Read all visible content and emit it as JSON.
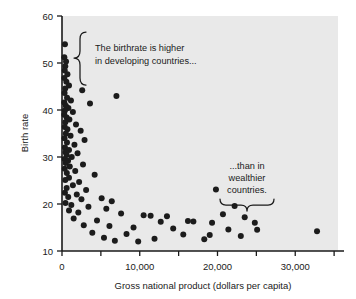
{
  "chart_data": {
    "type": "scatter",
    "title": "",
    "xlabel": "Gross national product (dollars per capita)",
    "ylabel": "Birth rate",
    "xlim": [
      0,
      35500
    ],
    "ylim": [
      10,
      60
    ],
    "xticks": [
      0,
      10000,
      20000,
      30000
    ],
    "xtick_labels": [
      "0",
      "10,000",
      "20,000",
      "30,000"
    ],
    "xminor_ticks": [
      5000,
      15000,
      25000,
      35000
    ],
    "yticks": [
      10,
      20,
      30,
      40,
      50,
      60
    ],
    "ytick_labels": [
      "10",
      "20",
      "30",
      "40",
      "50",
      "60"
    ],
    "grid": false,
    "legend": "none",
    "marker_color": "#1c1c1c",
    "plot_background": "#e9e9e9",
    "points": [
      [
        380,
        54.0
      ],
      [
        300,
        51.2
      ],
      [
        520,
        50.3
      ],
      [
        420,
        49.3
      ],
      [
        350,
        48.4
      ],
      [
        700,
        47.6
      ],
      [
        300,
        46.8
      ],
      [
        560,
        46.0
      ],
      [
        900,
        45.2
      ],
      [
        420,
        44.6
      ],
      [
        2600,
        44.2
      ],
      [
        330,
        43.6
      ],
      [
        7000,
        43.0
      ],
      [
        650,
        42.6
      ],
      [
        1150,
        42.0
      ],
      [
        300,
        41.6
      ],
      [
        3600,
        41.4
      ],
      [
        500,
        40.9
      ],
      [
        820,
        40.4
      ],
      [
        380,
        39.9
      ],
      [
        1400,
        39.6
      ],
      [
        300,
        39.0
      ],
      [
        600,
        38.4
      ],
      [
        950,
        38.0
      ],
      [
        430,
        37.4
      ],
      [
        1800,
        36.9
      ],
      [
        350,
        36.4
      ],
      [
        700,
        35.9
      ],
      [
        2400,
        35.6
      ],
      [
        500,
        35.0
      ],
      [
        1100,
        34.5
      ],
      [
        320,
        34.0
      ],
      [
        2900,
        33.6
      ],
      [
        640,
        33.1
      ],
      [
        1600,
        32.6
      ],
      [
        380,
        32.0
      ],
      [
        900,
        31.5
      ],
      [
        450,
        31.0
      ],
      [
        2000,
        30.8
      ],
      [
        600,
        30.4
      ],
      [
        1250,
        30.0
      ],
      [
        330,
        29.6
      ],
      [
        780,
        29.2
      ],
      [
        480,
        28.7
      ],
      [
        2700,
        28.4
      ],
      [
        1000,
        28.0
      ],
      [
        350,
        27.5
      ],
      [
        1700,
        27.0
      ],
      [
        620,
        26.6
      ],
      [
        4200,
        26.2
      ],
      [
        900,
        25.6
      ],
      [
        420,
        25.1
      ],
      [
        2200,
        24.7
      ],
      [
        1400,
        24.0
      ],
      [
        600,
        23.4
      ],
      [
        3100,
        23.0
      ],
      [
        19800,
        23.1
      ],
      [
        380,
        22.4
      ],
      [
        1900,
        22.0
      ],
      [
        800,
        21.5
      ],
      [
        2500,
        21.0
      ],
      [
        5100,
        21.2
      ],
      [
        6400,
        20.6
      ],
      [
        450,
        20.2
      ],
      [
        1200,
        19.8
      ],
      [
        3400,
        19.4
      ],
      [
        5700,
        19.0
      ],
      [
        22200,
        19.6
      ],
      [
        900,
        18.6
      ],
      [
        2100,
        18.2
      ],
      [
        7600,
        18.0
      ],
      [
        10500,
        17.6
      ],
      [
        11400,
        17.5
      ],
      [
        13500,
        17.4
      ],
      [
        20700,
        17.8
      ],
      [
        23500,
        17.2
      ],
      [
        1500,
        16.9
      ],
      [
        4500,
        16.5
      ],
      [
        12700,
        16.2
      ],
      [
        16200,
        16.4
      ],
      [
        16900,
        16.3
      ],
      [
        19300,
        16.0
      ],
      [
        24800,
        16.0
      ],
      [
        2800,
        15.5
      ],
      [
        6100,
        15.3
      ],
      [
        9200,
        15.0
      ],
      [
        14300,
        14.8
      ],
      [
        21400,
        14.6
      ],
      [
        25100,
        14.5
      ],
      [
        32800,
        14.2
      ],
      [
        3900,
        13.9
      ],
      [
        8300,
        13.6
      ],
      [
        15600,
        13.5
      ],
      [
        19000,
        13.4
      ],
      [
        23000,
        13.2
      ],
      [
        5400,
        12.8
      ],
      [
        11900,
        12.6
      ],
      [
        18300,
        12.5
      ],
      [
        6800,
        12.2
      ],
      [
        9800,
        12.0
      ]
    ],
    "annotations": [
      {
        "id": "developing",
        "lines": [
          "The birthrate is higher",
          "in developing countries..."
        ],
        "brace": "left"
      },
      {
        "id": "wealthier",
        "lines": [
          "...than in",
          "wealthier",
          "countries."
        ],
        "brace": "down"
      }
    ]
  }
}
